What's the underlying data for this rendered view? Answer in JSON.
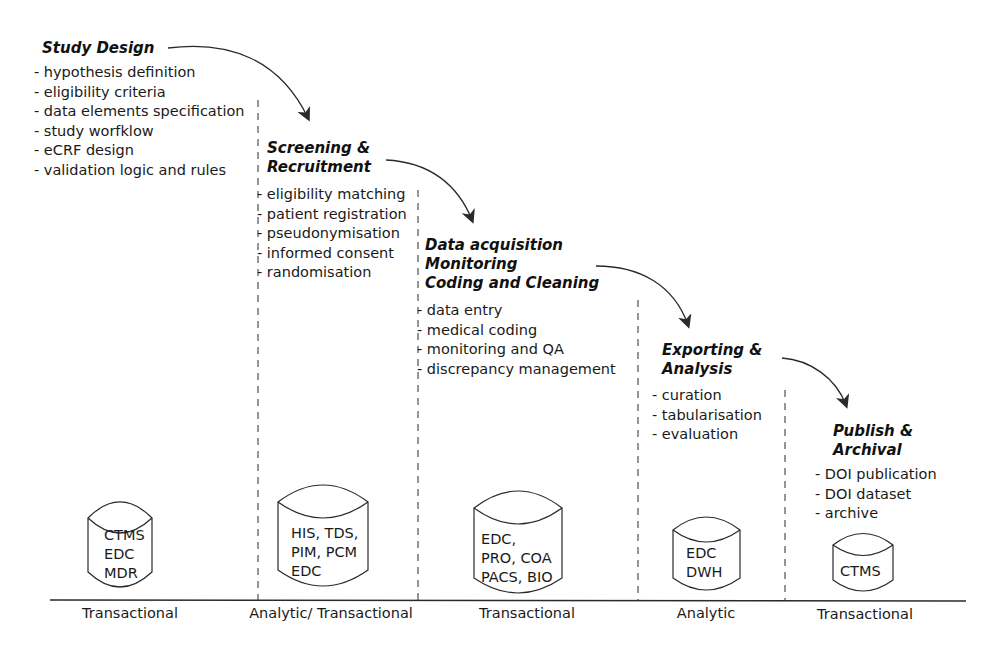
{
  "diagram": {
    "stroke_color": "#2a2a2a",
    "phases": [
      {
        "title": "Study Design",
        "tasks": [
          "hypothesis definition",
          "eligibility criteria",
          "data elements specification",
          "study worfklow",
          "eCRF design",
          "validation logic and rules"
        ],
        "systems": [
          "CTMS",
          "EDC",
          "MDR"
        ],
        "system_type": "Transactional"
      },
      {
        "title": "Screening &\nRecruitment",
        "tasks": [
          "eligibility matching",
          "patient registration",
          "pseudonymisation",
          "informed consent",
          "randomisation"
        ],
        "systems": [
          "HIS, TDS,",
          "PIM, PCM",
          "EDC"
        ],
        "system_type": "Analytic/ Transactional"
      },
      {
        "title": "Data acquisition\nMonitoring\nCoding and Cleaning",
        "tasks": [
          "data entry",
          "medical coding",
          "monitoring and QA",
          "discrepancy management"
        ],
        "systems": [
          "EDC,",
          "PRO, COA",
          "PACS, BIO"
        ],
        "system_type": "Transactional"
      },
      {
        "title": "Exporting &\nAnalysis",
        "tasks": [
          "curation",
          "tabularisation",
          "evaluation"
        ],
        "systems": [
          "EDC",
          "DWH"
        ],
        "system_type": "Analytic"
      },
      {
        "title": "Publish &\nArchival",
        "tasks": [
          "DOI publication",
          "DOI dataset",
          "archive"
        ],
        "systems": [
          "CTMS"
        ],
        "system_type": "Transactional"
      }
    ]
  }
}
